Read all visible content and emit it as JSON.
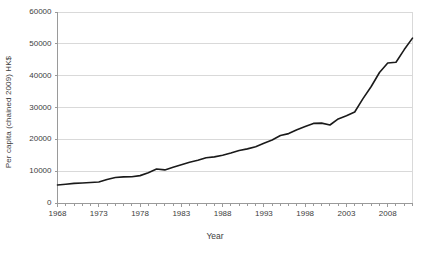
{
  "chart_data": {
    "type": "line",
    "title": "",
    "xlabel": "Year",
    "ylabel": "Per capita (chained 2009) HK$",
    "xlim": [
      1968,
      2011
    ],
    "ylim": [
      0,
      60000
    ],
    "grid": true,
    "legend_position": "none",
    "line_color": "#1a1a1a",
    "gridline_color": "#d9d9d9",
    "axis_color": "#9a9a9a",
    "text_color": "#3d3d3d",
    "ytick_labels": [
      "0",
      "10000",
      "20000",
      "30000",
      "40000",
      "50000",
      "60000"
    ],
    "ytick_values": [
      0,
      10000,
      20000,
      30000,
      40000,
      50000,
      60000
    ],
    "xtick_labels": [
      "1968",
      "1973",
      "1978",
      "1983",
      "1988",
      "1993",
      "1998",
      "2003",
      "2008"
    ],
    "xtick_values": [
      1968,
      1973,
      1978,
      1983,
      1988,
      1993,
      1998,
      2003,
      2008
    ],
    "x_minor_tick_interval": 1,
    "series": [
      {
        "name": "Per capita GDP (chained 2009) HK$",
        "x": [
          1968,
          1969,
          1970,
          1971,
          1972,
          1973,
          1974,
          1975,
          1976,
          1977,
          1978,
          1979,
          1980,
          1981,
          1982,
          1983,
          1984,
          1985,
          1986,
          1987,
          1988,
          1989,
          1990,
          1991,
          1992,
          1993,
          1994,
          1995,
          1996,
          1997,
          1998,
          1999,
          2000,
          2001,
          2002,
          2003,
          2004,
          2005,
          2006,
          2007,
          2008,
          2009,
          2010,
          2011
        ],
        "values": [
          5660,
          5900,
          6150,
          6300,
          6450,
          6600,
          7400,
          8000,
          8200,
          8250,
          8600,
          9500,
          10700,
          10400,
          11200,
          12000,
          12800,
          13400,
          14200,
          14500,
          15000,
          15700,
          16500,
          17000,
          17700,
          18800,
          19800,
          21200,
          21800,
          23000,
          24000,
          25000,
          25100,
          24500,
          26400,
          27400,
          28600,
          32800,
          36600,
          41000,
          44000,
          44200,
          48200,
          51800
        ]
      }
    ]
  }
}
